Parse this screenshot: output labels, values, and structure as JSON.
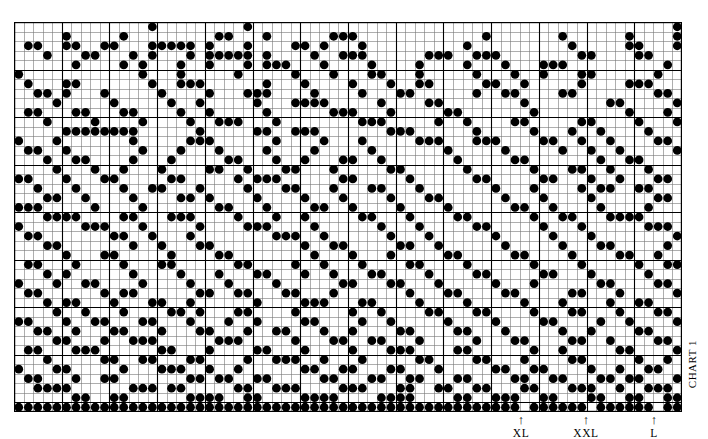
{
  "chart_data": {
    "type": "heatmap",
    "title": "CHART 1",
    "xlabel": "",
    "ylabel": "",
    "columns": 70,
    "rows": 41,
    "cell_px": 9.54,
    "symbol": "filled-dot",
    "grid": true,
    "grid_color": "#000000",
    "bold_gridline_every": 5,
    "fill_color": "#000000",
    "background_color": "#ffffff",
    "legend": [],
    "size_markers": [
      {
        "label": "XL",
        "column": 53,
        "x_px": 521
      },
      {
        "label": "XXL",
        "column": 60,
        "x_px": 586
      },
      {
        "label": "L",
        "column": 67,
        "x_px": 654
      }
    ],
    "marker_arrow_glyph": "↑",
    "rows_data": [
      "0000000000000010000000001000000000000000000000000000000000000000000001",
      "0000010000010000000001100010000001110000000000000100000001000000100001",
      "0110011001100011111010001000011010001000000000010000000000100000110001",
      "0001000110001010001011111010000100111000000111001110000000011000011000",
      "0000001000010100010010001011100010000100001000010001000111000000000010",
      "1000000000000100010000010000010001000110001000001000100100011000000100",
      "0100011000000010011100000010001000010001001100000110010000010000111000",
      "0011010001000001000010001110000100001000110000001001100001100000000110",
      "0000100000100000100100000100011110000010000110000000010000000011000001",
      "0110001100011000010010000010000001110001000001100000001000000000100010",
      "0001000010000100001001110001000000001110000010010000110000011000010001",
      "0000011111111000000100000110011100000001110000001000001000100100001000",
      "1000100000001000001110000001000010001000001110001110000110010010000110",
      "0110010000000100010001000010000100000100000001000001000001001001000001",
      "0001001100001000100000110001001000110010000000100000110000000100110000",
      "0000100010010001000011001000110001000001100000010000001000110010001000",
      "1100010001100000110000010111000000110000010000001100000110001001000110",
      "0010001000010011000100001000110001000110001000000010001000010110011000",
      "0001100100001000011010000100001000100001000110000001000100001000000110",
      "1110000010000100000001100010000110010000100001000000110010000100001000",
      "0001111000011000111000010001001000001100010000110000001001100011110000",
      "1000000111000100000100001110000100000010001000001100000100010000001110",
      "0110000000110010001000000001110010000001000100000010000010001000000001",
      "0001100000001001000110000000001001100000110010000001000001000110000010",
      "0000010001100000100001100000000100010001000001100000110000100001100100",
      "0110001000010001100000011000010010001000011000010000001000010000010011",
      "0001010000001000010001000110001001000110000100001100000110001000001000",
      "1000100110000100001000100001000000110001100010000010001000000110000110",
      "0110000001011000000110011000110001000000010001100001100000110001000001",
      "0001011000100011001000000100001110001100001000010000010001000010011000",
      "0000100100010000110100011000010000010010000110001100001000110001000110",
      "1100010011000110001000100100001100001001000001000010000110000100100001",
      "0011001000110001000110001001100010010000110000110001000001001000011000",
      "0000110001001110000001110000010001100110001000001000110000110010000110",
      "0110001110000001100010000110001000010001110000110000001001000001100001",
      "0001000001100110001100001001110010001000001100001100010000110000010010",
      "1000110000010001110010010000001100110001100010000011001100001001001100",
      "0110001001100000001101100110000011000110011000110000110011000110110001",
      "0011110000001110110000011001110000111000110011001100011000111001001110",
      "0000001100110000001111001100001111000011110000110011100110001100110011",
      "1111111111111111111111111111111111111111111111111111101111110111111011"
    ]
  },
  "page": {
    "background": "#ffffff"
  }
}
